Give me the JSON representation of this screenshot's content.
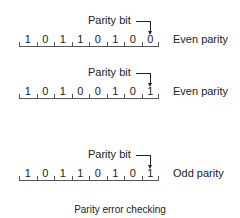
{
  "diagram": {
    "caption": "Parity error checking",
    "rows": [
      {
        "pointer_label": "Parity bit",
        "bits": [
          "1",
          "0",
          "1",
          "1",
          "0",
          "1",
          "0",
          "0"
        ],
        "parity_type": "Even parity"
      },
      {
        "pointer_label": "Parity bit",
        "bits": [
          "1",
          "0",
          "1",
          "0",
          "0",
          "1",
          "0",
          "1"
        ],
        "parity_type": "Even parity"
      },
      {
        "pointer_label": "Parity bit",
        "bits": [
          "1",
          "0",
          "1",
          "1",
          "0",
          "1",
          "0",
          "1"
        ],
        "parity_type": "Odd parity"
      }
    ],
    "colors": {
      "text": "#222222",
      "line": "#555555",
      "background": "#ffffff"
    }
  }
}
